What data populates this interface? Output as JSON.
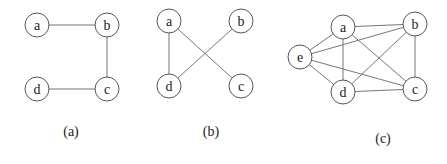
{
  "graphs": [
    {
      "id": "a",
      "caption": "(a)",
      "caption_pos": [
        71,
        136
      ],
      "nodes": [
        {
          "label": "a",
          "x": 37,
          "y": 25
        },
        {
          "label": "b",
          "x": 107,
          "y": 25
        },
        {
          "label": "c",
          "x": 107,
          "y": 89
        },
        {
          "label": "d",
          "x": 37,
          "y": 89
        }
      ],
      "edges": [
        [
          "a",
          "b"
        ],
        [
          "b",
          "c"
        ],
        [
          "c",
          "d"
        ]
      ]
    },
    {
      "id": "b",
      "caption": "(b)",
      "caption_pos": [
        211,
        136
      ],
      "nodes": [
        {
          "label": "a",
          "x": 169,
          "y": 21
        },
        {
          "label": "b",
          "x": 241,
          "y": 21
        },
        {
          "label": "c",
          "x": 241,
          "y": 86
        },
        {
          "label": "d",
          "x": 169,
          "y": 86
        }
      ],
      "edges": [
        [
          "a",
          "d"
        ],
        [
          "a",
          "c"
        ],
        [
          "b",
          "d"
        ]
      ]
    },
    {
      "id": "c",
      "caption": "(c)",
      "caption_pos": [
        383,
        143
      ],
      "nodes": [
        {
          "label": "a",
          "x": 343,
          "y": 27
        },
        {
          "label": "b",
          "x": 415,
          "y": 24
        },
        {
          "label": "c",
          "x": 415,
          "y": 89
        },
        {
          "label": "d",
          "x": 343,
          "y": 92
        },
        {
          "label": "e",
          "x": 300,
          "y": 57
        }
      ],
      "edges": [
        [
          "a",
          "b"
        ],
        [
          "a",
          "e"
        ],
        [
          "a",
          "d"
        ],
        [
          "a",
          "c"
        ],
        [
          "b",
          "e"
        ],
        [
          "b",
          "d"
        ],
        [
          "b",
          "c"
        ],
        [
          "e",
          "d"
        ],
        [
          "e",
          "c"
        ],
        [
          "d",
          "c"
        ]
      ]
    }
  ],
  "node_radius": 12
}
